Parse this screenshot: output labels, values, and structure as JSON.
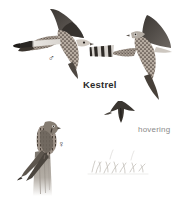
{
  "plate": {
    "width": 191,
    "height": 198,
    "background_color": "#ffffff",
    "subject": "Kestrel"
  },
  "labels": {
    "species": "Kestrel",
    "behaviour": "hovering",
    "species_color": "#2b2b2b",
    "behaviour_color": "#8a8a8a"
  },
  "symbols": {
    "male": "♂",
    "female": "♀"
  },
  "figures": [
    {
      "name": "kestrel-flight-male",
      "pose": "flying-left-underside",
      "sex": "male",
      "notes": "spread wings, dark wingtips, pale grey tail with black terminal band, spotted rufous underparts"
    },
    {
      "name": "kestrel-flight-barred-tail",
      "pose": "flying-right-underside",
      "sex": "female",
      "notes": "spread wings, dark wingtips, barred tail, spotted underparts"
    },
    {
      "name": "kestrel-hovering-silhouette",
      "pose": "hovering",
      "sex": "unspecified",
      "notes": "small dark distant silhouette with raised wings and fanned tail"
    },
    {
      "name": "kestrel-perched-female",
      "pose": "perched-on-post",
      "sex": "female",
      "notes": "streaked brown bird perched upright on a weathered wooden fence post"
    }
  ],
  "decorations": [
    {
      "name": "grass-sketch",
      "notes": "faint pencil grass tufts at lower right"
    },
    {
      "name": "fence-post",
      "notes": "weathered split wooden post fading at base"
    }
  ]
}
